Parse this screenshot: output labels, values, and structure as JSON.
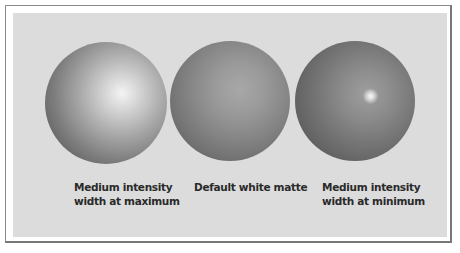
{
  "figure": {
    "spheres": [
      {
        "id": "sphere-1",
        "caption_lines": [
          "Medium intensity",
          "width at maximum"
        ]
      },
      {
        "id": "sphere-2",
        "caption_lines": [
          "Default white matte"
        ]
      },
      {
        "id": "sphere-3",
        "caption_lines": [
          "Medium intensity",
          "width at minimum"
        ]
      }
    ],
    "colors": {
      "panel": "#dcdcdc",
      "frame": "#8a8a8a",
      "text": "#2a2a2a"
    }
  }
}
